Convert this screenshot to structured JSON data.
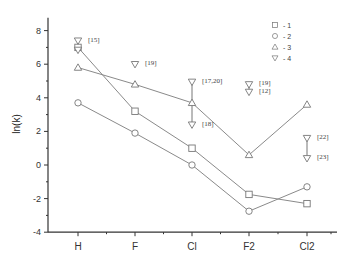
{
  "chart_data": {
    "type": "line",
    "title": "",
    "xlabel": "",
    "ylabel": "ln(k)",
    "categories": [
      "H",
      "F",
      "Cl",
      "F2",
      "Cl2"
    ],
    "ylim": [
      -4,
      9
    ],
    "yticks": [
      -4,
      -2,
      0,
      2,
      4,
      6,
      8
    ],
    "grid": false,
    "legend_position": "upper right",
    "series": [
      {
        "name": "1",
        "marker": "square",
        "values": [
          7.0,
          3.2,
          1.0,
          -1.75,
          -2.3
        ]
      },
      {
        "name": "2",
        "marker": "circle",
        "values": [
          3.7,
          1.9,
          0.0,
          -2.75,
          -1.3
        ]
      },
      {
        "name": "3",
        "marker": "triangle-up",
        "values": [
          5.8,
          4.8,
          3.7,
          0.6,
          3.6
        ]
      },
      {
        "name": "4",
        "marker": "triangle-down",
        "line": false,
        "points": [
          {
            "category": "H",
            "value": 7.4,
            "ref": "[15]"
          },
          {
            "category": "H",
            "value": 6.85,
            "ref": ""
          },
          {
            "category": "F",
            "value": 6.0,
            "ref": "[19]"
          },
          {
            "category": "Cl",
            "value": 4.95,
            "ref": "[17,20]"
          },
          {
            "category": "Cl",
            "value": 2.4,
            "ref": "[18]"
          },
          {
            "category": "F2",
            "value": 4.8,
            "ref": "[19]"
          },
          {
            "category": "F2",
            "value": 4.35,
            "ref": "[12]"
          },
          {
            "category": "Cl2",
            "value": 1.6,
            "ref": "[22]"
          },
          {
            "category": "Cl2",
            "value": 0.4,
            "ref": "[23]"
          }
        ],
        "ranges": [
          {
            "category": "Cl",
            "from": 4.95,
            "to": 2.4
          },
          {
            "category": "F2",
            "from": 4.8,
            "to": 4.35
          },
          {
            "category": "Cl2",
            "from": 1.6,
            "to": 0.4
          }
        ]
      }
    ],
    "legend": [
      "□ - 1",
      "○ - 2",
      "△ - 3",
      "▽ - 4"
    ]
  }
}
